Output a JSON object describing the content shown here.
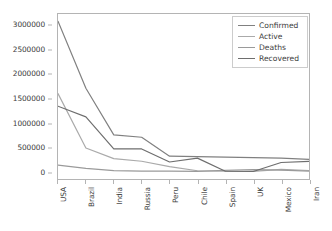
{
  "chart_data": {
    "type": "line",
    "title": "",
    "xlabel": "",
    "ylabel": "",
    "categories": [
      "USA",
      "Brazil",
      "India",
      "Russia",
      "Peru",
      "Chile",
      "Spain",
      "UK",
      "Mexico",
      "Iran"
    ],
    "series": [
      {
        "name": "Confirmed",
        "color": "#808080",
        "values": [
          3100000,
          1720000,
          760000,
          710000,
          320000,
          310000,
          300000,
          290000,
          280000,
          255000
        ]
      },
      {
        "name": "Active",
        "color": "#aaaaaa",
        "values": [
          1610000,
          490000,
          270000,
          215000,
          105000,
          20000,
          10000,
          8000,
          50000,
          25000
        ]
      },
      {
        "name": "Deaths",
        "color": "#9a9a9a",
        "values": [
          135000,
          68000,
          21000,
          11000,
          11500,
          6800,
          28000,
          45000,
          33000,
          13000
        ]
      },
      {
        "name": "Recovered",
        "color": "#6e6e6e",
        "values": [
          1350000,
          1130000,
          470000,
          470000,
          200000,
          280000,
          10000,
          5000,
          190000,
          215000
        ]
      }
    ],
    "ylim": [
      -150000,
      3250000
    ],
    "yticks": [
      0,
      500000,
      1000000,
      1500000,
      2000000,
      2500000,
      3000000
    ],
    "ytick_labels": [
      "0",
      "500000",
      "1000000",
      "1500000",
      "2000000",
      "2500000",
      "3000000"
    ],
    "grid": false,
    "legend_position": "upper right",
    "legend_entries": [
      "Confirmed",
      "Active",
      "Deaths",
      "Recovered"
    ],
    "frame_color": "#b4b4b4",
    "background_color": "#ffffff",
    "xtick_rotation": -90
  }
}
